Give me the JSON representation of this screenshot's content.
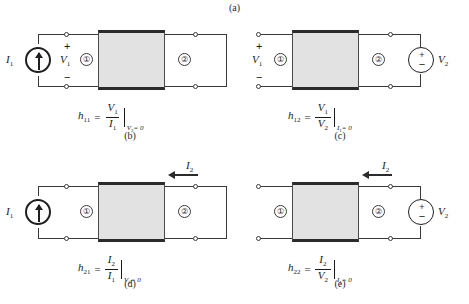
{
  "figure": {
    "title_caption": "(a)",
    "captions": {
      "a": "(a)",
      "b": "(b)",
      "c": "(c)",
      "d": "(d)",
      "e": "(e)"
    }
  },
  "labels": {
    "port_one": "①",
    "port_two": "②",
    "i1": "I",
    "i1_sub": "1",
    "i2": "I",
    "i2_sub": "2",
    "v1": "V",
    "v1_sub": "1",
    "v2": "V",
    "v2_sub": "2",
    "plus": "+",
    "minus": "−"
  },
  "panels": [
    {
      "id": "b",
      "caption": "(b)",
      "left_source": "current-source",
      "left_source_label": "I",
      "left_source_sub": "1",
      "right_source": "short-circuit",
      "port1_number": "①",
      "port2_number": "②",
      "shows_v1_polarity": true,
      "shows_i2_arrow": false,
      "formula": {
        "symbol": "h",
        "symbol_sub": "11",
        "equals": "=",
        "numerator": "V",
        "numerator_sub": "1",
        "denominator": "I",
        "denominator_sub": "1",
        "condition": "V",
        "condition_sub": "2",
        "condition_value": "= 0"
      }
    },
    {
      "id": "c",
      "caption": "(c)",
      "left_source": "open-circuit",
      "right_source": "voltage-source",
      "right_source_label": "V",
      "right_source_sub": "2",
      "port1_number": "①",
      "port2_number": "②",
      "shows_v1_polarity": true,
      "shows_i2_arrow": false,
      "formula": {
        "symbol": "h",
        "symbol_sub": "12",
        "equals": "=",
        "numerator": "V",
        "numerator_sub": "1",
        "denominator": "V",
        "denominator_sub": "2",
        "condition": "I",
        "condition_sub": "1",
        "condition_value": "= 0"
      }
    },
    {
      "id": "d",
      "caption": "(d)",
      "left_source": "current-source",
      "left_source_label": "I",
      "left_source_sub": "1",
      "right_source": "short-circuit",
      "port1_number": "①",
      "port2_number": "②",
      "shows_v1_polarity": false,
      "shows_i2_arrow": true,
      "i2_label": "I",
      "i2_sub": "2",
      "formula": {
        "symbol": "h",
        "symbol_sub": "21",
        "equals": "=",
        "numerator": "I",
        "numerator_sub": "2",
        "denominator": "I",
        "denominator_sub": "1",
        "condition": "V",
        "condition_sub": "2",
        "condition_value": "= 0"
      }
    },
    {
      "id": "e",
      "caption": "(e)",
      "left_source": "open-circuit",
      "right_source": "voltage-source",
      "right_source_label": "V",
      "right_source_sub": "2",
      "port1_number": "①",
      "port2_number": "②",
      "shows_v1_polarity": false,
      "shows_i2_arrow": true,
      "i2_label": "I",
      "i2_sub": "2",
      "formula": {
        "symbol": "h",
        "symbol_sub": "22",
        "equals": "=",
        "numerator": "I",
        "numerator_sub": "2",
        "denominator": "V",
        "denominator_sub": "2",
        "condition": "I",
        "condition_sub": "1",
        "condition_value": "= 0"
      }
    }
  ],
  "colors": {
    "box_fill": "#e2e2e2",
    "box_border": "#2b2b2b",
    "wire": "#3a3a3a",
    "text": "#1a1a1a",
    "background": "#ffffff"
  }
}
